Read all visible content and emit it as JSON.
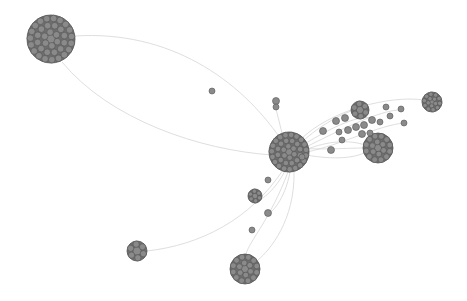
{
  "graph": {
    "type": "network",
    "colors": {
      "background": "#ffffff",
      "edge": "#d8d8d8",
      "node_fill": "#8a8a8a",
      "node_stroke": "#555555",
      "cluster_fill": "#6e6e6e"
    },
    "clusters": [
      {
        "id": "c-topleft",
        "cx": 51,
        "cy": 39,
        "r": 24,
        "rings": 3
      },
      {
        "id": "c-hub",
        "cx": 289,
        "cy": 152,
        "r": 20,
        "rings": 3
      },
      {
        "id": "c-right-mid",
        "cx": 378,
        "cy": 148,
        "r": 15,
        "rings": 2
      },
      {
        "id": "c-right-top",
        "cx": 432,
        "cy": 102,
        "r": 10,
        "rings": 2
      },
      {
        "id": "c-upper-mid",
        "cx": 360,
        "cy": 110,
        "r": 9,
        "rings": 1
      },
      {
        "id": "c-bottom",
        "cx": 245,
        "cy": 269,
        "r": 15,
        "rings": 2
      },
      {
        "id": "c-bottom-left",
        "cx": 137,
        "cy": 251,
        "r": 10,
        "rings": 1
      },
      {
        "id": "c-small-1",
        "cx": 255,
        "cy": 196,
        "r": 7,
        "rings": 1
      }
    ],
    "nodes": [
      {
        "cx": 212,
        "cy": 91,
        "r": 3
      },
      {
        "cx": 276,
        "cy": 101,
        "r": 3.5
      },
      {
        "cx": 276,
        "cy": 107,
        "r": 3
      },
      {
        "cx": 268,
        "cy": 180,
        "r": 3
      },
      {
        "cx": 268,
        "cy": 213,
        "r": 3.5
      },
      {
        "cx": 252,
        "cy": 230,
        "r": 3
      },
      {
        "cx": 323,
        "cy": 131,
        "r": 3.5
      },
      {
        "cx": 336,
        "cy": 121,
        "r": 3.5
      },
      {
        "cx": 339,
        "cy": 132,
        "r": 3
      },
      {
        "cx": 331,
        "cy": 150,
        "r": 3.5
      },
      {
        "cx": 345,
        "cy": 118,
        "r": 3.5
      },
      {
        "cx": 348,
        "cy": 130,
        "r": 3.5
      },
      {
        "cx": 356,
        "cy": 127,
        "r": 3.5
      },
      {
        "cx": 364,
        "cy": 125,
        "r": 3.5
      },
      {
        "cx": 372,
        "cy": 120,
        "r": 3.5
      },
      {
        "cx": 380,
        "cy": 122,
        "r": 3
      },
      {
        "cx": 390,
        "cy": 116,
        "r": 3
      },
      {
        "cx": 401,
        "cy": 109,
        "r": 3
      },
      {
        "cx": 404,
        "cy": 123,
        "r": 3
      },
      {
        "cx": 386,
        "cy": 107,
        "r": 3
      },
      {
        "cx": 342,
        "cy": 140,
        "r": 3
      },
      {
        "cx": 362,
        "cy": 134,
        "r": 3.5
      },
      {
        "cx": 370,
        "cy": 133,
        "r": 3
      },
      {
        "cx": 302,
        "cy": 157,
        "r": 3
      }
    ],
    "edges": [
      {
        "d": "M 75 36 C 170 30, 240 80, 280 138"
      },
      {
        "d": "M 62 62 C 110 120, 200 150, 272 155"
      },
      {
        "d": "M 276 109 L 282 133"
      },
      {
        "d": "M 300 140 C 330 110, 390 95, 424 100"
      },
      {
        "d": "M 303 145 C 335 125, 360 115, 372 118"
      },
      {
        "d": "M 305 150 C 330 140, 350 140, 365 145"
      },
      {
        "d": "M 306 155 C 335 160, 355 158, 366 152"
      },
      {
        "d": "M 302 142 C 320 125, 345 112, 355 110"
      },
      {
        "d": "M 304 148 C 340 130, 380 110, 400 110"
      },
      {
        "d": "M 307 152 C 340 145, 380 125, 404 123"
      },
      {
        "d": "M 285 171 C 275 190, 262 200, 258 200"
      },
      {
        "d": "M 290 172 C 285 200, 270 215, 268 213"
      },
      {
        "d": "M 288 172 C 270 220, 250 240, 246 254"
      },
      {
        "d": "M 294 172 C 295 220, 270 250, 258 260"
      },
      {
        "d": "M 283 170 C 250 220, 200 245, 147 251"
      },
      {
        "d": "M 300 148 C 320 150, 350 148, 363 148"
      }
    ]
  }
}
